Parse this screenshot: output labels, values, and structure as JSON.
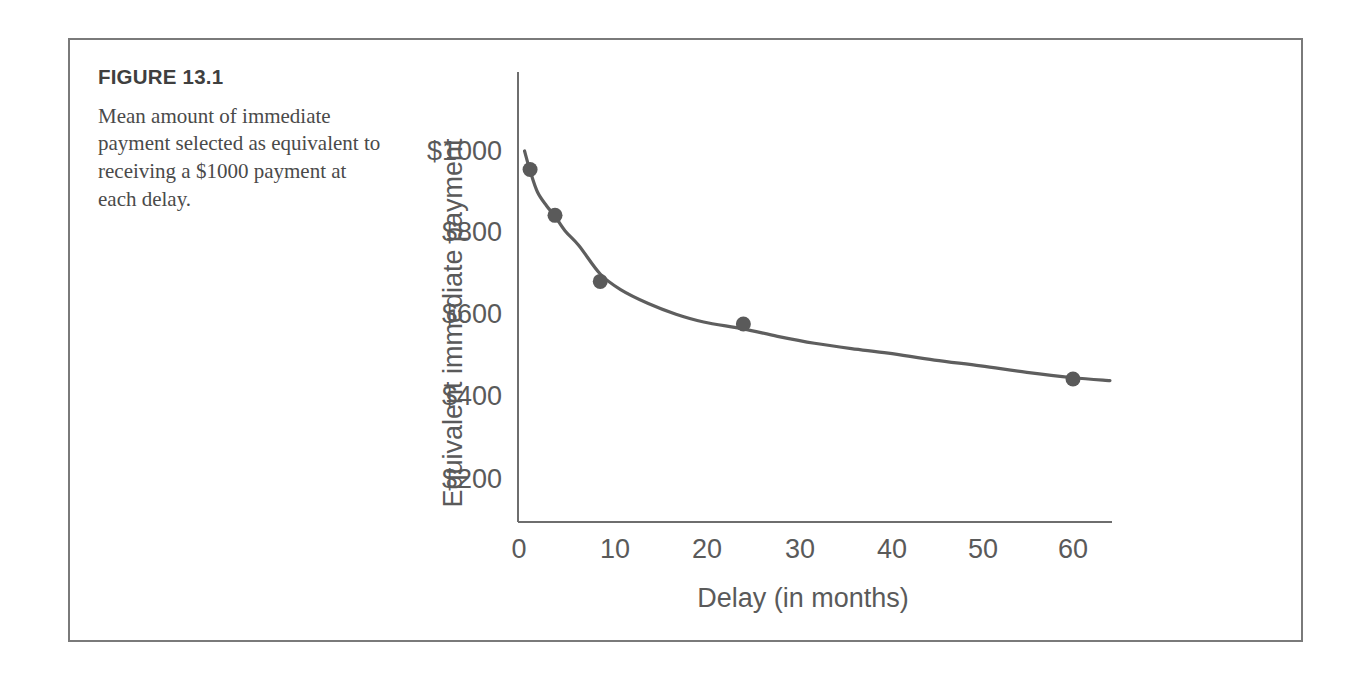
{
  "figure": {
    "number_label": "FIGURE 13.1",
    "caption": "Mean amount of immediate payment selected as equivalent to receiving a $1000 payment at each delay."
  },
  "colors": {
    "frame_border": "#7a7a7a",
    "axis": "#6e6e6e",
    "curve": "#5e5e5e",
    "point": "#5a5a5a",
    "text": "#4a4a4a",
    "tick_text": "#5a5a5a",
    "background": "#ffffff"
  },
  "chart_data": {
    "type": "scatter",
    "title": "",
    "xlabel": "Delay (in months)",
    "ylabel": "Equivalent immediate payment",
    "xlim": [
      0,
      64
    ],
    "ylim": [
      0,
      1080
    ],
    "grid": false,
    "legend": null,
    "xticks": [
      0,
      10,
      20,
      30,
      40,
      50,
      60
    ],
    "xticklabels": [
      "0",
      "10",
      "20",
      "30",
      "40",
      "50",
      "60"
    ],
    "yticks": [
      200,
      400,
      600,
      800,
      1000
    ],
    "yticklabels": [
      "$200",
      "$400",
      "$600",
      "$800",
      "$1000"
    ],
    "x": [
      1.2,
      3.9,
      8.8,
      24.3,
      60
    ],
    "y": [
      955,
      843,
      682,
      578,
      444
    ],
    "points": [
      {
        "x": 1.2,
        "y": 955
      },
      {
        "x": 3.9,
        "y": 843
      },
      {
        "x": 8.8,
        "y": 682
      },
      {
        "x": 24.3,
        "y": 578
      },
      {
        "x": 60,
        "y": 444
      }
    ],
    "fit_curve": {
      "description": "hyperbolic discounting fit",
      "x": [
        0.6,
        1.2,
        2,
        3,
        3.9,
        5,
        6.5,
        8.8,
        11,
        14,
        17,
        20,
        24.3,
        28,
        32,
        36,
        40,
        45,
        50,
        55,
        60,
        64
      ],
      "y": [
        1000,
        952,
        900,
        866,
        841,
        805,
        769,
        700,
        662,
        628,
        602,
        583,
        566,
        548,
        531,
        518,
        507,
        490,
        476,
        460,
        447,
        440
      ]
    }
  }
}
